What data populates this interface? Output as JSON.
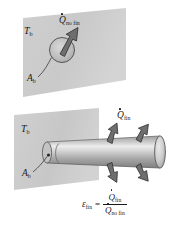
{
  "figure": {
    "background_color": "#ffffff"
  },
  "colors": {
    "wall_fill": "#c9c9c9",
    "wall_fill_light": "#d6d6d6",
    "wall_stroke": "#9a9a9a",
    "fin_light": "#e6e6e6",
    "fin_mid": "#b5b5b5",
    "fin_dark": "#8d8d8d",
    "arrow_fill": "#6b6b6b",
    "arrow_stroke": "#3a3a3a",
    "ink": "#1a1a1a",
    "circle_fill": "#bdbdbd"
  },
  "top_panel": {
    "name": "surface-without-fin",
    "base_temperature_label": {
      "symbol": "T",
      "subscript": "b"
    },
    "base_area_label": {
      "symbol": "A",
      "subscript": "b"
    },
    "heat_rate_label": {
      "symbol": "Q",
      "subscript": "no fin",
      "has_dot": true
    },
    "arrow_direction": "up-right"
  },
  "bottom_panel": {
    "name": "surface-with-fin",
    "base_temperature_label": {
      "symbol": "T",
      "subscript": "b"
    },
    "base_area_label": {
      "symbol": "A",
      "subscript": "b"
    },
    "heat_rate_label": {
      "symbol": "Q",
      "subscript": "fin",
      "has_dot": true
    },
    "fin_shape": "cylindrical-pin-fin",
    "arrow_count": 4,
    "arrow_directions": [
      "up-left",
      "up-right",
      "down-left",
      "down-right"
    ]
  },
  "equation": {
    "name": "fin-effectiveness-equation",
    "lhs": {
      "symbol": "ε",
      "subscript": "fin"
    },
    "operator": "=",
    "numerator": {
      "symbol": "Q",
      "subscript": "fin",
      "has_dot": true
    },
    "denominator": {
      "symbol": "Q",
      "subscript": "no fin",
      "has_dot": true
    },
    "plain_text": "ε_fin = Q̇_fin / Q̇_no fin"
  }
}
